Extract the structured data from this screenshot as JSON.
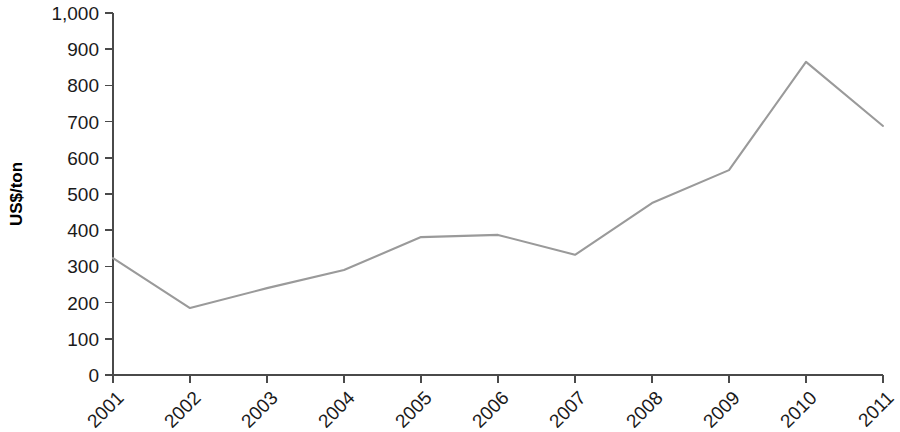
{
  "chart_data": {
    "type": "line",
    "title": "",
    "xlabel": "",
    "ylabel": "US$/ton",
    "categories": [
      "2001",
      "2002",
      "2003",
      "2004",
      "2005",
      "2006",
      "2007",
      "2008",
      "2009",
      "2010",
      "2011"
    ],
    "values": [
      323,
      185,
      240,
      290,
      381,
      387,
      332,
      475,
      566,
      865,
      688
    ],
    "x": [
      2001,
      2002,
      2003,
      2004,
      2005,
      2006,
      2007,
      2008,
      2009,
      2010,
      2011
    ],
    "ylim": [
      0,
      1000
    ],
    "ytick_values": [
      0,
      100,
      200,
      300,
      400,
      500,
      600,
      700,
      800,
      900,
      1000
    ],
    "ytick_labels": [
      "0",
      "100",
      "200",
      "300",
      "400",
      "500",
      "600",
      "700",
      "800",
      "900",
      "1,000"
    ],
    "xtick_labels": [
      "2001",
      "2002",
      "2003",
      "2004",
      "2005",
      "2006",
      "2007",
      "2008",
      "2009",
      "2010",
      "2011"
    ],
    "xtick_label_rotation": -45,
    "grid": false,
    "legend": null,
    "legend_position": "none",
    "series": [
      {
        "name": "Price",
        "color": "#9a9a9a",
        "values": [
          323,
          185,
          240,
          290,
          381,
          387,
          332,
          475,
          566,
          865,
          688
        ]
      }
    ],
    "colors": {
      "line": "#9a9a9a",
      "axis": "#4a4a4a",
      "text": "#1a1a1a",
      "background": "#ffffff"
    }
  }
}
